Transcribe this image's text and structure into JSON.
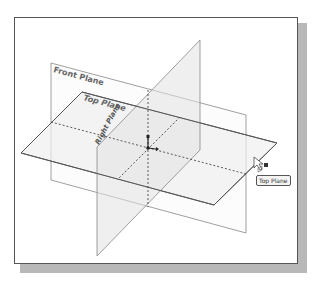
{
  "viewport": {
    "background": "#ffffff",
    "frame_border": "#555555",
    "shadow": "#b8b8b8"
  },
  "planes": {
    "front": {
      "label": "Front Plane"
    },
    "top": {
      "label": "Top Plane"
    },
    "right": {
      "label": "Right Plane"
    }
  },
  "cursor": {
    "icon": "select-pointer-icon",
    "badge_icon": "plane-select-icon"
  },
  "tooltip": {
    "text": "Top Plane"
  },
  "origin": {
    "icon": "origin-triad-icon"
  }
}
